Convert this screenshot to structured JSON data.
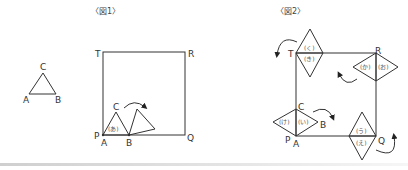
{
  "figure1": {
    "title": "〈図1〉",
    "small_triangle": {
      "labels": {
        "apex": "C",
        "left": "A",
        "right": "B"
      }
    },
    "square": {
      "corners": {
        "top_left": "T",
        "top_right": "R",
        "bottom_left": "P",
        "bottom_right": "Q"
      }
    },
    "rolling_triangle": {
      "labels": {
        "apex": "C",
        "left": "A",
        "right": "B"
      },
      "region_label": "(あ)"
    }
  },
  "figure2": {
    "title": "〈図2〉",
    "square": {
      "corners": {
        "top_left": "T",
        "top_right": "R",
        "bottom_left": "P",
        "bottom_right": "Q"
      }
    },
    "point_labels": {
      "c": "C",
      "b": "B",
      "a": "A"
    },
    "regions": {
      "i": "(い)",
      "ke": "(け)",
      "u": "(う)",
      "e": "(え)",
      "o": "(お)",
      "ka": "(か)",
      "ki": "(き)",
      "ku": "(く)"
    }
  },
  "colors": {
    "line": "#333333",
    "text": "#333333",
    "region_text": "#555555"
  }
}
